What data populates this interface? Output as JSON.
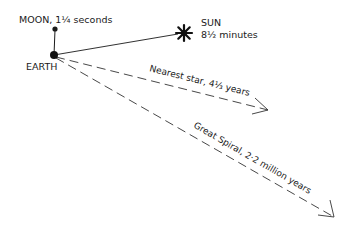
{
  "diagram": {
    "type": "light-travel-time",
    "colors": {
      "ink": "#1a1a1a",
      "background": "#ffffff"
    },
    "bodies": {
      "moon": {
        "label": "MOON, 1¼ seconds"
      },
      "earth": {
        "label": "EARTH"
      },
      "sun": {
        "label": "SUN",
        "time": "8½ minutes"
      }
    },
    "arrows": [
      {
        "label": "Nearest star, 4⅓ years",
        "style": "dashed"
      },
      {
        "label": "Great Spiral, 2·2 million years",
        "style": "dashed"
      }
    ]
  }
}
